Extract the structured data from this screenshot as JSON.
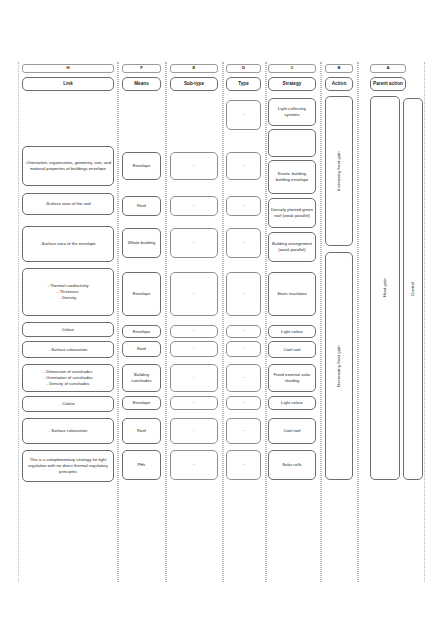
{
  "diagram": {
    "columns": [
      {
        "code": "H",
        "label": "Link"
      },
      {
        "code": "F",
        "label": "Means"
      },
      {
        "code": "E",
        "label": "Sub-type"
      },
      {
        "code": "D",
        "label": "Type"
      },
      {
        "code": "C",
        "label": "Strategy"
      },
      {
        "code": "B",
        "label": "Action"
      },
      {
        "code": "A",
        "label": "Parent action"
      }
    ],
    "link_items": [
      "-Orientation, organisation, geometry, size, and material properties of buildings envelope",
      "-Surface area of the roof",
      "-Surface area of the envelope",
      "- Thermal conductivity\n- Thickness\n- Density",
      "Colour",
      "- Surface colouration",
      "- Dimension of sunshades\n- Orientation of sunshades\n- Density of sunshades",
      "-Colour",
      "- Surface colouration",
      "This is a complementary strategy for light regulation with no direct thermal regulatory principles"
    ],
    "means_items": [
      "Envelope",
      "Roof",
      "Whole building",
      "Envelope",
      "Envelope",
      "Roof",
      "Building sunshades",
      "Envelope",
      "Roof",
      "PHs"
    ],
    "subtype_items": [
      "-",
      "-",
      "-",
      "-",
      "-",
      "-",
      "-",
      "-",
      "-",
      "-",
      "-"
    ],
    "type_items": [
      "-",
      "-",
      "-",
      "-",
      "-",
      "-",
      "-",
      "-",
      "-",
      "-",
      "-"
    ],
    "strategy_items": [
      "Light collecting systems",
      "",
      "Kinetic building building envelope",
      "Densely planted green roof (weak parallel)",
      "Building arrangement (weak parallel)",
      "Static insulation",
      "Light colour",
      "Cool roof",
      "Fixed external solar shading",
      "Light colour",
      "Cool roof",
      "Solar cells"
    ],
    "action_items": [
      "Increasing heat gain",
      "Decreasing heat gain"
    ],
    "parent_action_items": [
      "Heat gain",
      "Control"
    ]
  }
}
